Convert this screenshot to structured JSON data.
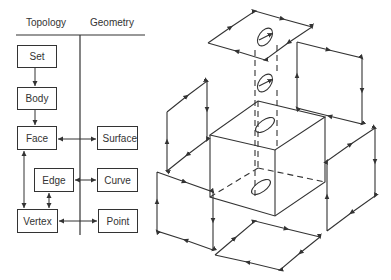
{
  "headers": {
    "topology": "Topology",
    "geometry": "Geometry"
  },
  "topology_entities": [
    {
      "id": "set",
      "label": "Set"
    },
    {
      "id": "body",
      "label": "Body"
    },
    {
      "id": "face",
      "label": "Face"
    },
    {
      "id": "edge",
      "label": "Edge"
    },
    {
      "id": "vertex",
      "label": "Vertex"
    }
  ],
  "geometry_entities": [
    {
      "id": "surface",
      "label": "Surface"
    },
    {
      "id": "curve",
      "label": "Curve"
    },
    {
      "id": "point",
      "label": "Point"
    }
  ],
  "relations": [
    {
      "from": "Set",
      "to": "Body",
      "type": "one-way"
    },
    {
      "from": "Body",
      "to": "Face",
      "type": "one-way"
    },
    {
      "from": "Face",
      "to": "Vertex",
      "type": "two-way"
    },
    {
      "from": "Edge",
      "to": "Vertex",
      "type": "two-way"
    },
    {
      "from": "Face",
      "to": "Surface",
      "type": "two-way"
    },
    {
      "from": "Edge",
      "to": "Curve",
      "type": "two-way"
    },
    {
      "from": "Vertex",
      "to": "Point",
      "type": "two-way"
    }
  ],
  "exploded_solid": {
    "description": "Exploded view of a cube with a through-hole; faces separated with oriented edge loops",
    "faces": [
      "top",
      "back-left",
      "back-right",
      "front-left",
      "front-right",
      "bottom"
    ],
    "inner_loops": 2
  },
  "colors": {
    "line": "#333333",
    "background": "#ffffff"
  }
}
